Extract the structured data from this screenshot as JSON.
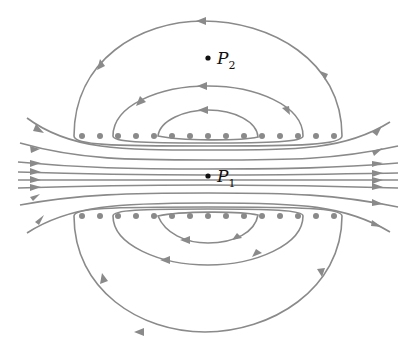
{
  "diagram": {
    "type": "magnetic field lines around two rows of parallel wires (solenoid cross-section)",
    "colors": {
      "field_line": "#8a8a8a",
      "wire_dot": "#8a8a8a",
      "point": "#111111",
      "background": "#ffffff"
    },
    "points": [
      {
        "id": "P2",
        "label": "P",
        "subscript": "2",
        "x": 208,
        "y": 58
      },
      {
        "id": "P1",
        "label": "P",
        "subscript": "1",
        "x": 208,
        "y": 176
      }
    ],
    "wire_rows": [
      {
        "name": "upper-row",
        "y": 136,
        "count": 15
      },
      {
        "name": "lower-row",
        "y": 216,
        "count": 15
      }
    ],
    "field_line_direction": "left-to-right through interior; loops circulate counter-clockwise above, clockwise below"
  }
}
